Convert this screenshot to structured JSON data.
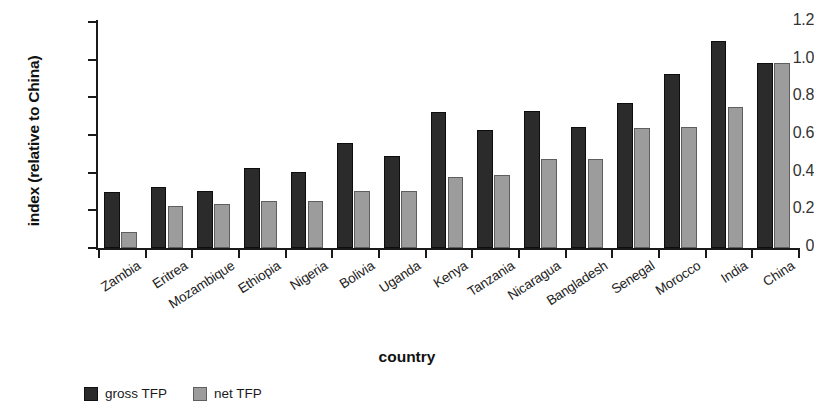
{
  "chart_data": {
    "type": "bar",
    "title": "",
    "xlabel": "country",
    "ylabel": "index (relative to China)",
    "ylim": [
      0,
      1.2
    ],
    "yticks": [
      "0",
      "0.2",
      "0.4",
      "0.6",
      "0.8",
      "1.0",
      "1.2"
    ],
    "ytick_values": [
      0,
      0.2,
      0.4,
      0.6,
      0.8,
      1.0,
      1.2
    ],
    "grid": false,
    "legend_position": "bottom-left",
    "categories": [
      "Zambia",
      "Eritrea",
      "Mozambique",
      "Ethiopia",
      "Nigeria",
      "Bolivia",
      "Uganda",
      "Kenya",
      "Tanzania",
      "Nicaragua",
      "Bangladesh",
      "Senegal",
      "Morocco",
      "India",
      "China"
    ],
    "series": [
      {
        "name": "gross TFP",
        "color": "#2b2b2b",
        "values": [
          0.295,
          0.325,
          0.305,
          0.425,
          0.405,
          0.56,
          0.49,
          0.72,
          0.625,
          0.73,
          0.645,
          0.77,
          0.925,
          1.1,
          0.985
        ]
      },
      {
        "name": "net TFP",
        "color": "#9c9c9c",
        "values": [
          0.085,
          0.225,
          0.235,
          0.25,
          0.25,
          0.305,
          0.305,
          0.375,
          0.39,
          0.475,
          0.475,
          0.635,
          0.645,
          0.75,
          0.985
        ]
      }
    ]
  },
  "legend": {
    "items": [
      {
        "label": "gross TFP",
        "key": "gross"
      },
      {
        "label": "net TFP",
        "key": "net"
      }
    ]
  },
  "colors": {
    "gross": "#2b2b2b",
    "net": "#9c9c9c",
    "axis": "#1a1a1a",
    "background": "#ffffff"
  }
}
